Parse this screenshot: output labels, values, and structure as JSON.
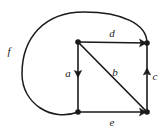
{
  "figure": {
    "kind": "directed-graph",
    "background_color": "#ffffff",
    "stroke_color": "#1a1a1a",
    "label_color": "#1a1a1a",
    "width": 166,
    "height": 135
  },
  "vertices": [
    {
      "id": "top-left",
      "name": "vertex-top-left",
      "x": 78,
      "y": 42,
      "radius": 2.6
    },
    {
      "id": "top-right",
      "name": "vertex-top-right",
      "x": 147,
      "y": 43,
      "radius": 2.6
    },
    {
      "id": "bottom-left",
      "name": "vertex-bottom-left",
      "x": 78,
      "y": 112,
      "radius": 2.6
    },
    {
      "id": "bottom-right",
      "name": "vertex-bottom-right",
      "x": 147,
      "y": 112,
      "radius": 2.6
    }
  ],
  "edges": [
    {
      "id": "a",
      "label": "a",
      "from": "top-left",
      "to": "bottom-left",
      "direction": "down",
      "label_x": 68,
      "label_y": 77,
      "arrow_at": {
        "x": 78,
        "y": 75
      },
      "arrow_angle": 90
    },
    {
      "id": "b",
      "label": "b",
      "from": "top-left",
      "to": "bottom-right",
      "direction": "down-right",
      "label_x": 115,
      "label_y": 76,
      "arrow_at": {
        "x": 143,
        "y": 108
      },
      "arrow_angle": 45
    },
    {
      "id": "c",
      "label": "c",
      "from": "bottom-right",
      "to": "top-right",
      "direction": "up",
      "label_x": 154,
      "label_y": 80,
      "arrow_at": {
        "x": 147,
        "y": 71
      },
      "arrow_angle": -90
    },
    {
      "id": "d",
      "label": "d",
      "from": "top-left",
      "to": "top-right",
      "direction": "right",
      "label_x": 112,
      "label_y": 37,
      "arrow_at": {
        "x": 145,
        "y": 43
      },
      "arrow_angle": 0
    },
    {
      "id": "e",
      "label": "e",
      "from": "bottom-left",
      "to": "bottom-right",
      "direction": "right",
      "label_x": 112,
      "label_y": 125,
      "arrow_at": {
        "x": 145,
        "y": 112
      },
      "arrow_angle": 0
    },
    {
      "id": "f",
      "label": "f",
      "from": "bottom-left",
      "to": "top-right",
      "direction": "curved-loop-counterclockwise",
      "label_x": 9,
      "label_y": 55,
      "path": "M 78,112 C 52,122 22,104 22,74 C 22,38 44,12 84,12 C 122,12 147,24 147,43",
      "arrow_at": null,
      "arrow_angle": null
    }
  ]
}
